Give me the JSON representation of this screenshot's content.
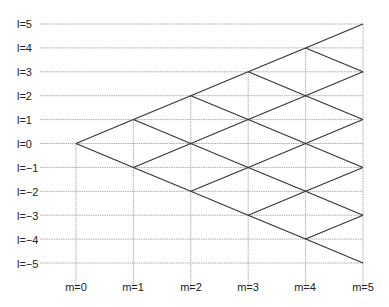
{
  "diagram": {
    "row_labels": [
      "l=5",
      "l=4",
      "l=3",
      "l=2",
      "l=1",
      "l=0",
      "l=−1",
      "l=−2",
      "l=−3",
      "l=−4",
      "l=−5"
    ],
    "col_labels": [
      "m=0",
      "m=1",
      "m=2",
      "m=3",
      "m=4",
      "m=5"
    ],
    "l_values": [
      5,
      4,
      3,
      2,
      1,
      0,
      -1,
      -2,
      -3,
      -4,
      -5
    ],
    "m_values": [
      0,
      1,
      2,
      3,
      4,
      5
    ],
    "grid_color": "#999999",
    "line_color": "#333333"
  }
}
